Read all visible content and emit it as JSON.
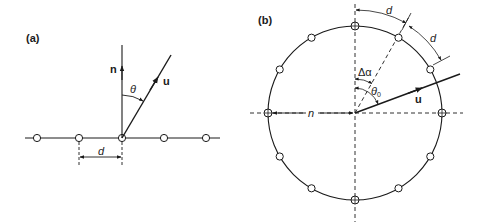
{
  "figure": {
    "panel_a": {
      "label": "(a)",
      "normal_label": "n",
      "vector_label": "u",
      "angle_label": "θ",
      "spacing_label": "d",
      "element_count": 5
    },
    "panel_b": {
      "label": "(b)",
      "radius_label": "n",
      "vector_label": "u",
      "delta_angle_label": "Δα",
      "angle_label": "θ",
      "angle_subscript": "0",
      "arc_spacing_label_1": "d",
      "arc_spacing_label_2": "d",
      "element_count": 12
    },
    "colors": {
      "stroke": "#1a1a1a",
      "background": "#ffffff"
    }
  }
}
